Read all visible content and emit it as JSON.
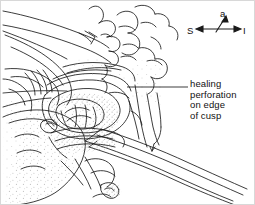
{
  "figure": {
    "type": "medical-line-drawing",
    "background_color": "#ffffff",
    "ink_color": "#1a1a1a",
    "stipple_color": "#b9b9b9",
    "width": 255,
    "height": 205
  },
  "annotation": {
    "name": "healing-perforation-label",
    "lines": [
      "healing",
      "perforation",
      "on edge",
      "of cusp"
    ],
    "text": "healing\nperforation\non edge\nof cusp",
    "leader_line": {
      "from_x": 126,
      "from_y": 86,
      "to_x": 187,
      "to_y": 86
    }
  },
  "compass": {
    "name": "orientation-compass",
    "anterior": "a",
    "superior": "S",
    "inferior": "I",
    "axes": [
      {
        "label": "a",
        "direction": "up-right",
        "position": "top"
      },
      {
        "label": "S",
        "direction": "left",
        "position": "left"
      },
      {
        "label": "I",
        "direction": "right",
        "position": "right"
      }
    ]
  }
}
